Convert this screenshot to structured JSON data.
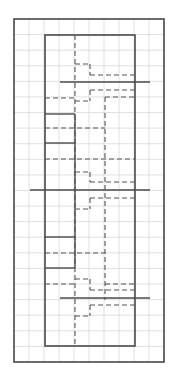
{
  "diagram": {
    "type": "floor-plan-grid",
    "colors": {
      "background": "#ffffff",
      "grid": "#d9d9d9",
      "solid": "#4a4a4a",
      "dashed": "#555555"
    },
    "grid": {
      "x0": 14,
      "y0": 19,
      "spacing": 15.3,
      "cols": 10,
      "rows": 22
    },
    "outer_frame": {
      "x": 14,
      "y": 19,
      "w": 150,
      "h": 343
    },
    "inner_frame": {
      "x": 45,
      "y": 35,
      "w": 90,
      "h": 311
    },
    "solid_lines": [
      [
        45,
        114,
        75,
        114
      ],
      [
        45,
        143,
        75,
        143
      ],
      [
        45,
        237,
        75,
        237
      ],
      [
        45,
        268,
        75,
        268
      ],
      [
        75,
        114,
        75,
        268
      ],
      [
        60,
        82,
        150,
        82
      ],
      [
        30,
        190,
        150,
        190
      ],
      [
        60,
        298,
        150,
        298
      ]
    ],
    "dashed_lines": [
      [
        75,
        35,
        75,
        346
      ],
      [
        75,
        64,
        90,
        64
      ],
      [
        90,
        64,
        90,
        75
      ],
      [
        90,
        75,
        135,
        75
      ],
      [
        90,
        90,
        135,
        90
      ],
      [
        90,
        90,
        90,
        101
      ],
      [
        75,
        101,
        90,
        101
      ],
      [
        45,
        98,
        75,
        98
      ],
      [
        105,
        97,
        135,
        97
      ],
      [
        105,
        97,
        105,
        300
      ],
      [
        45,
        128,
        105,
        128
      ],
      [
        45,
        159,
        135,
        159
      ],
      [
        75,
        172,
        90,
        172
      ],
      [
        90,
        172,
        90,
        182
      ],
      [
        90,
        182,
        135,
        182
      ],
      [
        90,
        198,
        135,
        198
      ],
      [
        90,
        198,
        90,
        209
      ],
      [
        75,
        209,
        90,
        209
      ],
      [
        45,
        253,
        105,
        253
      ],
      [
        45,
        284,
        75,
        284
      ],
      [
        75,
        279,
        90,
        279
      ],
      [
        90,
        279,
        90,
        290
      ],
      [
        90,
        290,
        135,
        290
      ],
      [
        105,
        284,
        135,
        284
      ],
      [
        90,
        305,
        135,
        305
      ],
      [
        90,
        305,
        90,
        316
      ],
      [
        75,
        316,
        90,
        316
      ]
    ]
  }
}
